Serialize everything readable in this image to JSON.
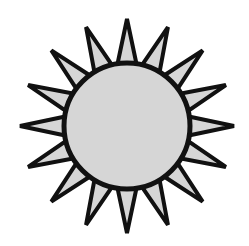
{
  "image": {
    "subject": "sun-icon",
    "width": 249,
    "height": 246,
    "background": "#ffffff"
  },
  "sun": {
    "center": [
      127,
      126
    ],
    "disc_radius": 63,
    "ray_count": 16,
    "ray_tip_radius": 107,
    "ray_base_radius": 58,
    "ray_half_angle_deg": 10.5,
    "fill_color": "#d6d6d6",
    "stroke_color": "#111111",
    "stroke_width": 4
  }
}
